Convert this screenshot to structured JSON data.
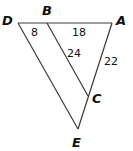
{
  "diagram": {
    "type": "geometry-triangles",
    "vertices": {
      "D": {
        "label": "D",
        "x": 18,
        "y": 23
      },
      "B": {
        "label": "B",
        "x": 47,
        "y": 23
      },
      "A": {
        "label": "A",
        "x": 112,
        "y": 23
      },
      "C": {
        "label": "C",
        "x": 88,
        "y": 96
      },
      "E": {
        "label": "E",
        "x": 78,
        "y": 129
      }
    },
    "segments": [
      {
        "from": "D",
        "to": "A"
      },
      {
        "from": "A",
        "to": "E"
      },
      {
        "from": "D",
        "to": "E"
      },
      {
        "from": "B",
        "to": "C"
      }
    ],
    "measurements": {
      "DB": "8",
      "BA": "18",
      "BC": "24",
      "AC": "22"
    },
    "colors": {
      "line": "#3a3a3a",
      "text": "#111111",
      "background": "#ffffff"
    }
  }
}
